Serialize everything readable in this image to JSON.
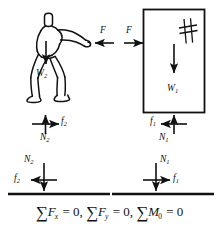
{
  "figure": {
    "stroke_color": "#111111",
    "background_color": "#ffffff"
  },
  "top_row": {
    "person": {
      "name": "person-pushing",
      "weight_label": "W",
      "weight_sub": "2",
      "applied_force_label": "F",
      "applied_force_direction": "left"
    },
    "block": {
      "name": "block",
      "weight_label": "W",
      "weight_sub": "1",
      "applied_force_label": "F",
      "applied_force_direction": "right",
      "hatch_mark": "crosshatch-mark"
    }
  },
  "middle_row": {
    "person_contact": {
      "normal_label": "N",
      "normal_sub": "2",
      "normal_direction": "up",
      "friction_label": "f",
      "friction_sub": "2",
      "friction_direction": "right"
    },
    "block_contact": {
      "normal_label": "N",
      "normal_sub": "1",
      "normal_direction": "up",
      "friction_label": "f",
      "friction_sub": "1",
      "friction_direction": "left"
    }
  },
  "bottom_row": {
    "ground_left": {
      "normal_label": "N",
      "normal_sub": "2",
      "normal_direction": "down",
      "friction_label": "f",
      "friction_sub": "2",
      "friction_direction": "left"
    },
    "ground_right": {
      "normal_label": "N",
      "normal_sub": "1",
      "normal_direction": "down",
      "friction_label": "f",
      "friction_sub": "1",
      "friction_direction": "right"
    }
  },
  "equations": {
    "sigma": "∑",
    "eq1": {
      "var": "F",
      "sub": "x",
      "rhs": "= 0,"
    },
    "eq2": {
      "var": "F",
      "sub": "y",
      "rhs": "= 0,"
    },
    "eq3": {
      "var": "M",
      "sub": "0",
      "rhs": "= 0"
    }
  }
}
